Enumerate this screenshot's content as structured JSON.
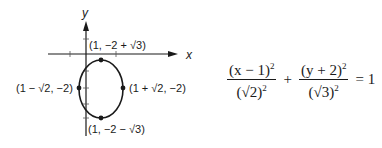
{
  "graph": {
    "x_axis_label": "x",
    "y_axis_label": "y",
    "points": {
      "top": "(1, −2 + √3)",
      "bottom": "(1, −2 − √3)",
      "left": "(1 − √2, −2)",
      "right": "(1 + √2, −2)"
    }
  },
  "equation": {
    "num1": "(x − 1)",
    "num1_exp": "2",
    "den1": "(√2)",
    "den1_exp": "2",
    "plus": "+",
    "num2": "(y + 2)",
    "num2_exp": "2",
    "den2": "(√3)",
    "den2_exp": "2",
    "equals": "=",
    "rhs": "1"
  }
}
